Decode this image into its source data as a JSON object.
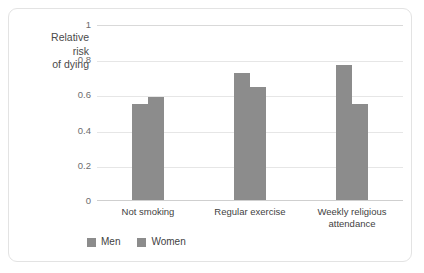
{
  "chart_data": {
    "type": "bar",
    "title": "",
    "subtitle": "",
    "xlabel": "",
    "ylabel": "Relative\nrisk\nof dying",
    "categories": [
      "Not smoking",
      "Regular exercise",
      "Weekly religious\nattendance"
    ],
    "series": [
      {
        "name": "Men",
        "values": [
          0.55,
          0.73,
          0.77
        ]
      },
      {
        "name": "Women",
        "values": [
          0.59,
          0.65,
          0.55
        ]
      }
    ],
    "ylim": [
      0,
      1
    ],
    "ytick_labels": [
      "0",
      "0.2",
      "0.4",
      "0.6",
      "0.8",
      "1"
    ],
    "ytick_values": [
      0,
      0.2,
      0.4,
      0.6,
      0.8,
      1
    ],
    "grid": "horizontal",
    "legend_position": "bottom-left",
    "colors": {
      "men": "#8c8c8c",
      "women": "#8c8c8c",
      "gridline": "#e6e6e6",
      "axis": "#cfcfcf",
      "card_border": "#e3e3e3",
      "background": "#ffffff",
      "tick_text": "#6d6d6d",
      "label_text": "#3f3f3f"
    }
  }
}
